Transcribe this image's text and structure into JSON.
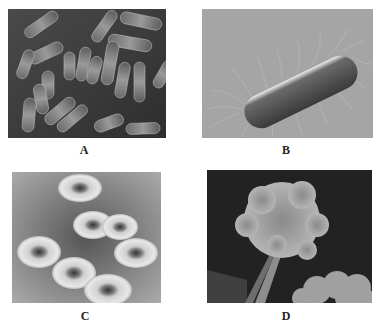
{
  "figure": {
    "panels": [
      {
        "id": "A",
        "label": "A",
        "subject": "rod-shaped bacteria cluster (electron micrograph)"
      },
      {
        "id": "B",
        "label": "B",
        "subject": "single rod bacterium with flagella"
      },
      {
        "id": "C",
        "label": "C",
        "subject": "fungal/bacterial colonies on plate"
      },
      {
        "id": "D",
        "label": "D",
        "subject": "mold conidiophore with spore chains"
      }
    ]
  }
}
